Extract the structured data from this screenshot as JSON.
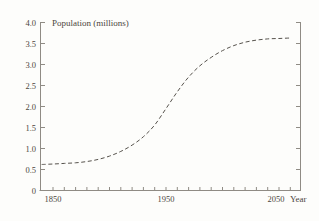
{
  "chart_data": {
    "type": "line",
    "title": "Population (millions)",
    "xlabel": "Year",
    "ylabel": "Population (millions)",
    "x": [
      1840,
      1850,
      1860,
      1870,
      1880,
      1890,
      1900,
      1910,
      1920,
      1930,
      1940,
      1950,
      1960,
      1970,
      1980,
      1990,
      2000,
      2010,
      2020,
      2030,
      2040,
      2050,
      2060
    ],
    "series": [
      {
        "name": "population",
        "style": "dashed",
        "values": [
          0.62,
          0.63,
          0.645,
          0.66,
          0.69,
          0.74,
          0.82,
          0.93,
          1.08,
          1.28,
          1.56,
          1.95,
          2.35,
          2.7,
          2.97,
          3.17,
          3.33,
          3.45,
          3.53,
          3.58,
          3.61,
          3.62,
          3.63
        ]
      }
    ],
    "xlim": [
      1839,
      2069
    ],
    "ylim": [
      0,
      4.0
    ],
    "y_ticks": [
      0,
      0.5,
      1.0,
      1.5,
      2.0,
      2.5,
      3.0,
      3.5,
      4.0
    ],
    "y_tick_labels": [
      "0",
      "0.5",
      "1.0",
      "1.5",
      "2.0",
      "2.5",
      "3.0",
      "3.5",
      "4.0"
    ],
    "x_minor_tick_interval_years": 10,
    "x_major_ticks": [
      1850,
      1950,
      2050
    ],
    "x_tick_labels": [
      "1850",
      "1950",
      "2050"
    ],
    "grid": false,
    "legend": false,
    "axes": {
      "left": true,
      "right": true,
      "bottom": true,
      "top": false,
      "ticks_inward": true
    }
  },
  "colors": {
    "background": "#fdfdfb",
    "axis": "#8f8b84",
    "tick": "#8f8b84",
    "curve": "#56524c",
    "text": "#4c463e"
  }
}
